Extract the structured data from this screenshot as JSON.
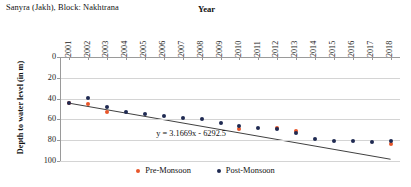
{
  "chart_data": {
    "type": "scatter",
    "title": "Sanyra (Jakh), Block: Nakhtrana",
    "xlabel": "Year",
    "ylabel": "Depth to water level (in m)",
    "xlim": [
      2000.5,
      2018.5
    ],
    "ylim": [
      0,
      100
    ],
    "y_inverted": true,
    "yticks": [
      0,
      20,
      40,
      60,
      80,
      100
    ],
    "grid": "horizontal",
    "legend_position": "bottom",
    "categories": [
      2001,
      2002,
      2003,
      2004,
      2005,
      2006,
      2007,
      2008,
      2009,
      2010,
      2011,
      2012,
      2013,
      2014,
      2015,
      2016,
      2017,
      2018
    ],
    "series": [
      {
        "name": "Pre-Monsoon",
        "color": "#e8562a",
        "values": [
          44.5,
          45.5,
          52.5,
          null,
          null,
          null,
          null,
          null,
          null,
          69.5,
          null,
          68.5,
          71.5,
          null,
          null,
          null,
          null,
          84.0
        ]
      },
      {
        "name": "Post-Monsoon",
        "color": "#1f2a52",
        "values": [
          44.0,
          39.5,
          48.0,
          52.5,
          55.0,
          57.0,
          58.5,
          60.0,
          63.0,
          66.5,
          68.0,
          69.5,
          73.5,
          79.0,
          80.5,
          80.5,
          81.5,
          81.0
        ]
      }
    ],
    "trendline": {
      "equation": "y = 3.1669x - 6292.5",
      "slope": 3.1669,
      "intercept": -6292.5,
      "x_start": 2001,
      "x_end": 2018,
      "label_x": 2005.6,
      "label_y": 74.5,
      "color": "#2a2a2a"
    }
  }
}
